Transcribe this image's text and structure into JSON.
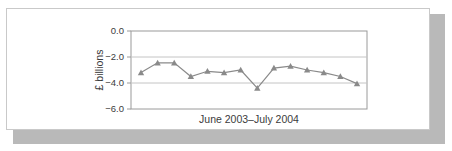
{
  "figure": {
    "background_color": "#ffffff",
    "border_color": "#c9c9c9",
    "shadow_color": "#b9b9b9"
  },
  "chart_data": {
    "type": "line",
    "title": "",
    "subtitle": "",
    "xlabel": "June 2003–July 2004",
    "ylabel": "£ billions",
    "ylim": [
      -6.0,
      0.0
    ],
    "ytick_labels": [
      "0.0",
      "−2.0",
      "−4.0",
      "−6.0"
    ],
    "ytick_values": [
      0.0,
      -2.0,
      -4.0,
      -6.0
    ],
    "grid": "horizontal",
    "gridline_values": [
      -2.0,
      -4.0
    ],
    "legend": "none",
    "marker": "triangle",
    "series_color": "#8a8a8a",
    "marker_color": "#8a8a8a",
    "categories": [
      "June 2003",
      "July 2003",
      "Aug 2003",
      "Sept 2003",
      "Oct 2003",
      "Nov 2003",
      "Dec 2003",
      "Jan 2004",
      "Feb 2004",
      "Mar 2004",
      "Apr 2004",
      "May 2004",
      "June 2004",
      "July 2004"
    ],
    "series": [
      {
        "name": "Trade deficit",
        "values": [
          -3.2,
          -2.45,
          -2.45,
          -3.5,
          -3.1,
          -3.2,
          -3.0,
          -4.4,
          -2.85,
          -2.7,
          -3.0,
          -3.2,
          -3.5,
          -4.05
        ]
      }
    ]
  }
}
